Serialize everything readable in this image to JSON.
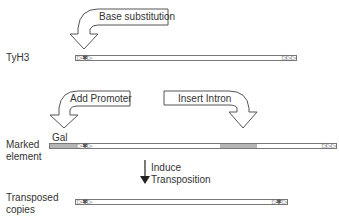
{
  "rows": {
    "tyh3": {
      "label": "TyH3"
    },
    "marked": {
      "label_line1": "Marked",
      "label_line2": "element",
      "gal_label": "Gal"
    },
    "transposed": {
      "label_line1": "Transposed",
      "label_line2": "copies"
    }
  },
  "callouts": {
    "base_substitution": "Base substitution",
    "add_promoter": "Add Promoter",
    "insert_intron": "Insert Intron"
  },
  "step_arrow": {
    "line1": "Induce",
    "line2": "Transposition"
  },
  "ltr_glyphs": {
    "left": "▷✱▷",
    "right": "▷▷▷",
    "star": "✱"
  },
  "colors": {
    "bar_border": "#777777",
    "promoter_fill": "#b5b5b5",
    "intron_fill": "#b5b5b5",
    "text": "#333333"
  }
}
